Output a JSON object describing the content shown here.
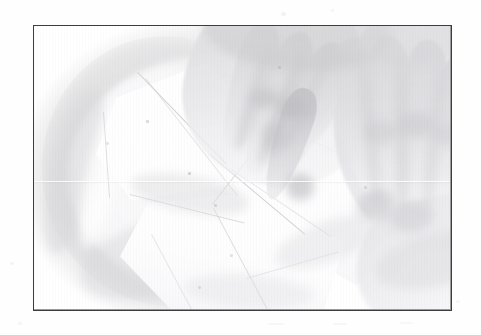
{
  "document": {
    "background_color": "#fefefe",
    "width": 481,
    "height": 335
  },
  "figure": {
    "name": "framed-photograph",
    "frame": {
      "border_color": "#3d3d40",
      "border_width_px": 1,
      "left": 33,
      "top": 25,
      "width": 419,
      "height": 286
    },
    "photo": {
      "style": "high-key black and white photograph",
      "tone_range": "near-white, washed out, overexposed",
      "subject": "two hands arranging sheets of dough in a round bowl",
      "caption": "",
      "alt_text": "Hands placing pastry dough pieces into a round bowl",
      "elements": [
        {
          "name": "bowl",
          "label": "round bowl",
          "tone": "#cfcfd2"
        },
        {
          "name": "dough-sheet-upper-left",
          "label": "dough wedge",
          "tone": "#ffffff"
        },
        {
          "name": "dough-sheet-diagonal",
          "label": "dough sliver",
          "tone": "#ffffff"
        },
        {
          "name": "dough-sheet-right",
          "label": "dough triangle",
          "tone": "#ffffff"
        },
        {
          "name": "dough-sheet-bottom",
          "label": "dough sheet",
          "tone": "#ffffff"
        },
        {
          "name": "left-hand",
          "label": "left hand",
          "tone": "#c4c4c9"
        },
        {
          "name": "right-hand",
          "label": "right hand",
          "tone": "#d4d4d9"
        }
      ],
      "artifacts": {
        "vertical_scan_stripes": true,
        "horizontal_seam_line": true,
        "margin_specks": true
      }
    }
  }
}
